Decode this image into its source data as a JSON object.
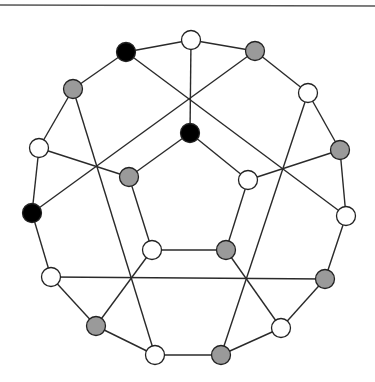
{
  "diagram": {
    "type": "graph",
    "colors": {
      "white": "#ffffff",
      "gray": "#9a9a9a",
      "black": "#000000",
      "edge": "#2a2a2a",
      "rule": "#555555"
    },
    "top_rule": {
      "x1": 0,
      "y1": 5,
      "x2": 375,
      "y2": 6
    },
    "node_radius": 9.5,
    "nodes": [
      {
        "id": "n0",
        "x": 191,
        "y": 40,
        "fill": "white"
      },
      {
        "id": "n1",
        "x": 126,
        "y": 52,
        "fill": "black"
      },
      {
        "id": "n2",
        "x": 255,
        "y": 51,
        "fill": "gray"
      },
      {
        "id": "n3",
        "x": 73,
        "y": 89,
        "fill": "gray"
      },
      {
        "id": "n4",
        "x": 308,
        "y": 93,
        "fill": "white"
      },
      {
        "id": "n5",
        "x": 190,
        "y": 133,
        "fill": "black"
      },
      {
        "id": "n6",
        "x": 39,
        "y": 148,
        "fill": "white"
      },
      {
        "id": "n7",
        "x": 340,
        "y": 150,
        "fill": "gray"
      },
      {
        "id": "n8",
        "x": 129,
        "y": 177,
        "fill": "gray"
      },
      {
        "id": "n9",
        "x": 248,
        "y": 180,
        "fill": "white"
      },
      {
        "id": "n10",
        "x": 32,
        "y": 213,
        "fill": "black"
      },
      {
        "id": "n11",
        "x": 346,
        "y": 216,
        "fill": "white"
      },
      {
        "id": "n12",
        "x": 152,
        "y": 250,
        "fill": "white"
      },
      {
        "id": "n13",
        "x": 226,
        "y": 250,
        "fill": "gray"
      },
      {
        "id": "n14",
        "x": 51,
        "y": 277,
        "fill": "white"
      },
      {
        "id": "n15",
        "x": 325,
        "y": 279,
        "fill": "gray"
      },
      {
        "id": "n16",
        "x": 96,
        "y": 326,
        "fill": "gray"
      },
      {
        "id": "n17",
        "x": 281,
        "y": 328,
        "fill": "white"
      },
      {
        "id": "n18",
        "x": 155,
        "y": 355,
        "fill": "white"
      },
      {
        "id": "n19",
        "x": 221,
        "y": 355,
        "fill": "gray"
      }
    ],
    "edges": [
      [
        "n0",
        "n1"
      ],
      [
        "n1",
        "n3"
      ],
      [
        "n3",
        "n6"
      ],
      [
        "n6",
        "n10"
      ],
      [
        "n10",
        "n14"
      ],
      [
        "n14",
        "n16"
      ],
      [
        "n16",
        "n18"
      ],
      [
        "n18",
        "n19"
      ],
      [
        "n19",
        "n17"
      ],
      [
        "n17",
        "n15"
      ],
      [
        "n15",
        "n11"
      ],
      [
        "n11",
        "n7"
      ],
      [
        "n7",
        "n4"
      ],
      [
        "n4",
        "n2"
      ],
      [
        "n2",
        "n0"
      ],
      [
        "n0",
        "n5"
      ],
      [
        "n1",
        "n11"
      ],
      [
        "n2",
        "n10"
      ],
      [
        "n3",
        "n18"
      ],
      [
        "n4",
        "n19"
      ],
      [
        "n6",
        "n8"
      ],
      [
        "n7",
        "n9"
      ],
      [
        "n14",
        "n15"
      ],
      [
        "n16",
        "n12"
      ],
      [
        "n17",
        "n13"
      ],
      [
        "n5",
        "n8"
      ],
      [
        "n8",
        "n12"
      ],
      [
        "n12",
        "n13"
      ],
      [
        "n13",
        "n9"
      ],
      [
        "n9",
        "n5"
      ]
    ]
  }
}
